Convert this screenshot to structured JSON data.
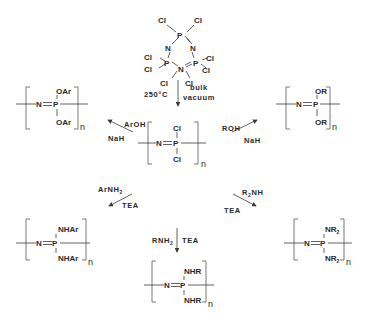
{
  "diagram": {
    "title": "",
    "colors": {
      "ink": "#2a2a2a",
      "background": "#ffffff"
    },
    "starting_material": {
      "name": "hexachlorocyclotriphosphazene",
      "atoms": {
        "P": "P",
        "N": "N",
        "Cl": "Cl"
      }
    },
    "ring_opening": {
      "left_label": "250°C",
      "right_label_1": "bulk",
      "right_label_2": "vacuum"
    },
    "center_polymer": {
      "backbone_N": "N",
      "backbone_P": "P",
      "top": "Cl",
      "bottom": "Cl",
      "repeat": "n"
    },
    "substitutions": [
      {
        "position": "top-left",
        "reagent_1": "ArOH",
        "reagent_2": "NaH",
        "product": {
          "backbone_N": "N",
          "backbone_P": "P",
          "top": "OAr",
          "bottom": "OAr",
          "repeat": "n"
        }
      },
      {
        "position": "top-right",
        "reagent_1": "ROH",
        "reagent_2": "NaH",
        "product": {
          "backbone_N": "N",
          "backbone_P": "P",
          "top": "OR",
          "bottom": "OR",
          "repeat": "n"
        }
      },
      {
        "position": "bottom-left",
        "reagent_1": "ArNH",
        "reagent_1_sub": "2",
        "reagent_2": "TEA",
        "product": {
          "backbone_N": "N",
          "backbone_P": "P",
          "top": "NHAr",
          "bottom": "NHAr",
          "repeat": "n"
        }
      },
      {
        "position": "bottom-right",
        "reagent_1_pre": "R",
        "reagent_1_sub": "2",
        "reagent_1_post": "NH",
        "reagent_2": "TEA",
        "product": {
          "backbone_N": "N",
          "backbone_P": "P",
          "top": "NR",
          "top_sub": "2",
          "bottom": "NR",
          "bottom_sub": "2",
          "repeat": "n"
        }
      },
      {
        "position": "bottom",
        "reagent_1": "RNH",
        "reagent_1_sub": "2",
        "reagent_2": "TEA",
        "product": {
          "backbone_N": "N",
          "backbone_P": "P",
          "top": "NHR",
          "bottom": "NHR",
          "repeat": "n"
        }
      }
    ]
  }
}
